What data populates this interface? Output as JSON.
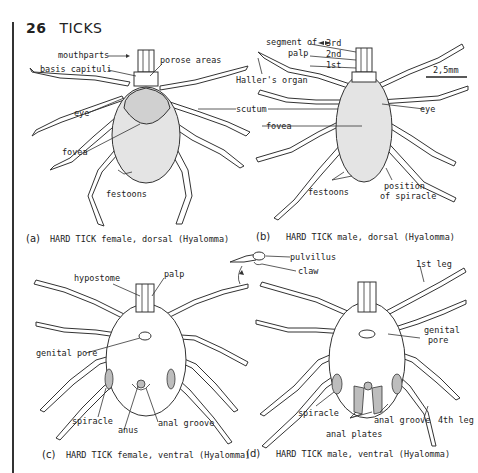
{
  "header": {
    "page_number": "26",
    "title": "TICKS"
  },
  "scale_bar": "2,5mm",
  "panels": {
    "a": {
      "letter": "(a)",
      "caption": "HARD TICK female, dorsal (Hyalomma)",
      "labels": {
        "mouthparts": "mouthparts",
        "porose_areas": "porose areas",
        "basis_capituli": "basis capituli",
        "eye": "eye",
        "fovea": "fovea",
        "festoons": "festoons"
      }
    },
    "b": {
      "letter": "(b)",
      "caption": "HARD TICK male, dorsal (Hyalomma)",
      "labels": {
        "segment_of": "segment of",
        "palp": "palp",
        "seg3": "3rd",
        "seg2": "2nd",
        "seg1": "1st",
        "hallers_organ": "Haller's organ",
        "scutum": "scutum",
        "eye": "eye",
        "fovea": "fovea",
        "festoons": "festoons",
        "position": "position",
        "of_spiracle": "of spiracle"
      }
    },
    "c": {
      "letter": "(c)",
      "caption": "HARD TICK female, ventral (Hyalomma)",
      "labels": {
        "hypostome": "hypostome",
        "palp": "palp",
        "genital_pore": "genital pore",
        "spiracle": "spiracle",
        "anus": "anus",
        "anal_groove": "anal groove"
      }
    },
    "d": {
      "letter": "(d)",
      "caption": "HARD TICK male, ventral (Hyalomma)",
      "labels": {
        "pulvillus": "pulvillus",
        "claw": "claw",
        "first_leg": "1st leg",
        "genital": "genital",
        "pore": "pore",
        "spiracle": "spiracle",
        "anal_groove": "anal groove",
        "fourth_leg": "4th leg",
        "anal_plates": "anal plates"
      }
    }
  }
}
